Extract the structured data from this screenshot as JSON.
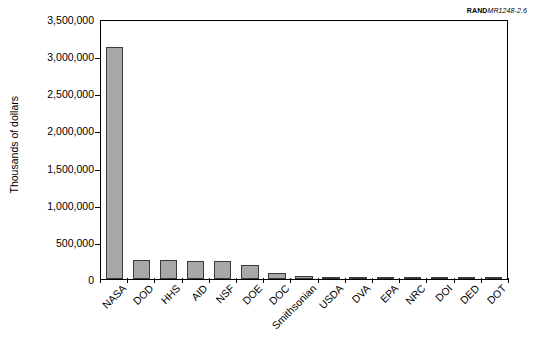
{
  "figure_id": {
    "brand": "RAND",
    "number": "MR1248-2.6"
  },
  "chart_data": {
    "type": "bar",
    "title": "",
    "xlabel": "",
    "ylabel": "Thousands of dollars",
    "ylim": [
      0,
      3500000
    ],
    "ytick_values": [
      0,
      500000,
      1000000,
      1500000,
      2000000,
      2500000,
      3000000,
      3500000
    ],
    "ytick_labels": [
      "0",
      "500,000",
      "1,000,000",
      "1,500,000",
      "2,000,000",
      "2,500,000",
      "3,000,000",
      "3,500,000"
    ],
    "grid": false,
    "legend": false,
    "bar_color": "#a8a8a8",
    "bar_edge_color": "#3a3a3a",
    "categories": [
      "NASA",
      "DOD",
      "HHS",
      "AID",
      "NSF",
      "DOE",
      "DOC",
      "Smithsonian",
      "USDA",
      "DVA",
      "EPA",
      "NRC",
      "DOI",
      "DED",
      "DOT"
    ],
    "values": [
      3120000,
      260000,
      250000,
      245000,
      240000,
      195000,
      75000,
      35000,
      25000,
      4000,
      3000,
      2500,
      2000,
      1500,
      1000
    ]
  }
}
